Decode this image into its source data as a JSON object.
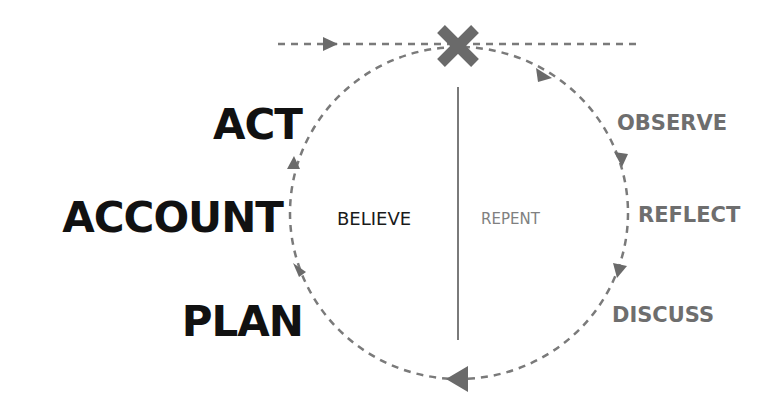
{
  "diagram": {
    "colors": {
      "left_text": "#111111",
      "right_text": "#6e6e6e",
      "believe_text": "#1a1a1a",
      "repent_text": "#808080",
      "line": "#7a7a7a",
      "marker": "#6a6a6a"
    },
    "markers": {
      "crossing": "x-mark-icon"
    },
    "left_labels": [
      {
        "id": "act",
        "label": "ACT"
      },
      {
        "id": "account",
        "label": "ACCOUNT"
      },
      {
        "id": "plan",
        "label": "PLAN"
      }
    ],
    "right_labels": [
      {
        "id": "observe",
        "label": "OBSERVE"
      },
      {
        "id": "reflect",
        "label": "REFLECT"
      },
      {
        "id": "discuss",
        "label": "DISCUSS"
      }
    ],
    "center": {
      "left": "BELIEVE",
      "right": "REPENT"
    }
  }
}
